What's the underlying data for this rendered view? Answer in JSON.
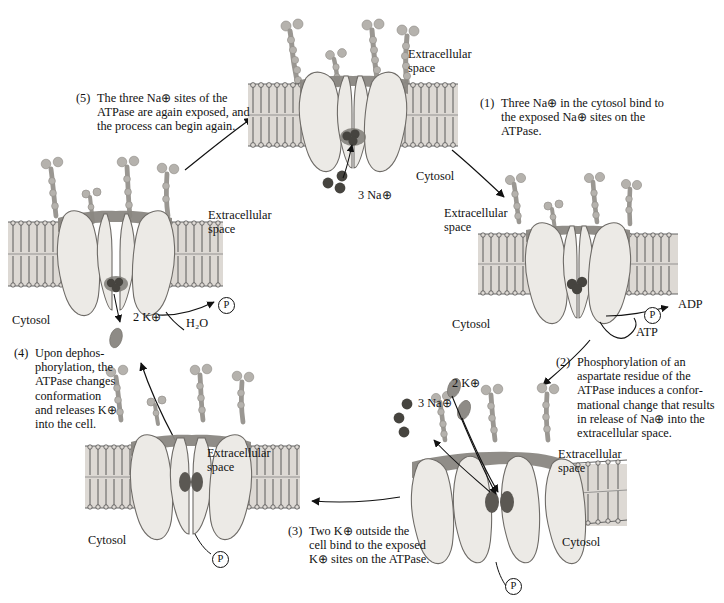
{
  "figure": {
    "colors": {
      "ink": "#111111",
      "protein_fill": "#e6e4e0",
      "protein_shadow": "#9a9792",
      "membrane_band": "#c9c6c1",
      "ion_dark": "#4a4845",
      "ion_light": "#8e8b86"
    }
  },
  "steps": [
    {
      "id": "step1",
      "number": "(1)",
      "text": "Three Na⊕ in the cytosol bind to the exposed Na⊕ sites on the ATPase."
    },
    {
      "id": "step2",
      "number": "(2)",
      "text": "Phosphorylation of an aspartate residue of the ATPase induces a confor-mational change that results in release of Na⊕ into the extracellular space."
    },
    {
      "id": "step3",
      "number": "(3)",
      "text": "Two K⊕ outside the cell bind to the exposed K⊕ sites on the ATPase."
    },
    {
      "id": "step4",
      "number": "(4)",
      "text": "Upon dephos-phorylation, the ATPase changes conformation and releases K⊕ into the cell."
    },
    {
      "id": "step5",
      "number": "(5)",
      "text": "The three Na⊕ sites of the ATPase are again exposed, and the process can begin again."
    }
  ],
  "panels": {
    "top": {
      "name": "panel-top-open-cytosol",
      "extracellular_label": "Extracellular\nspace",
      "cytosol_label": "Cytosol",
      "ion_label": "3 Na⊕"
    },
    "right": {
      "name": "panel-right-phosphorylation",
      "extracellular_label": "Extracellular\nspace",
      "cytosol_label": "Cytosol",
      "adp_label": "ADP",
      "atp_label": "ATP",
      "phosphate_label": "P"
    },
    "bottom_right": {
      "name": "panel-bottom-right-na-release",
      "extracellular_label": "Extracellular\nspace",
      "cytosol_label": "Cytosol",
      "na_label": "3 Na⊕",
      "k_label": "2 K⊕",
      "phosphate_label": "P"
    },
    "bottom_left": {
      "name": "panel-bottom-left-k-bound",
      "extracellular_label": "Extracellular\nspace",
      "cytosol_label": "Cytosol",
      "phosphate_label": "P"
    },
    "left": {
      "name": "panel-left-dephosphorylation",
      "extracellular_label": "Extracellular\nspace",
      "cytosol_label": "Cytosol",
      "k_label": "2 K⊕",
      "water_label": "H₂O",
      "phosphate_label": "P"
    }
  }
}
